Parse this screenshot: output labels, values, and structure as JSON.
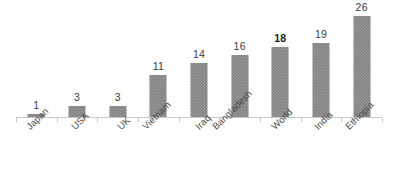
{
  "chart_data": {
    "type": "bar",
    "title": "",
    "subtitle": "",
    "xlabel": "",
    "ylabel": "",
    "categories": [
      "Japan",
      "USA",
      "UK",
      "Vietnam",
      "Iraq",
      "Bangladesh",
      "World",
      "India",
      "Ethiopia"
    ],
    "values": [
      1,
      3,
      3,
      11,
      14,
      16,
      18,
      19,
      26
    ],
    "value_labels": [
      "1",
      "3",
      "3",
      "11",
      "14",
      "16",
      "18",
      "19",
      "26"
    ],
    "emphasized_category": "World",
    "emphasized_index": 6,
    "ylim": [
      0,
      28
    ],
    "grid": false,
    "legend": null,
    "axis_visible": true,
    "tick_marks": true,
    "label_rotation_degrees": -45,
    "bar_color": "#808080",
    "background_color": "#ffffff",
    "axis_color": "#c9c9c9",
    "value_label_color": "#3b3b3b",
    "category_label_color": "#4a4a4a"
  }
}
